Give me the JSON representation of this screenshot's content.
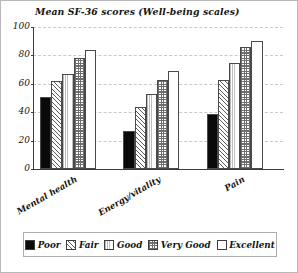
{
  "chart_data": {
    "type": "bar",
    "title": "Mean SF-36 scores (Well-being scales)",
    "xlabel": "",
    "ylabel": "",
    "ylim": [
      0,
      100
    ],
    "yticks": [
      0,
      20,
      40,
      60,
      80,
      100
    ],
    "grid": true,
    "legend_position": "bottom",
    "categories": [
      "Mental health",
      "Energy/vitality",
      "Pain"
    ],
    "series": [
      {
        "name": "Poor",
        "values": [
          51,
          27,
          39
        ],
        "pattern": "solid-black",
        "color": "#0a0a0a"
      },
      {
        "name": "Fair",
        "values": [
          62,
          44,
          63
        ],
        "pattern": "diagonal-hatch",
        "color": "#ffffff"
      },
      {
        "name": "Good",
        "values": [
          67,
          53,
          75
        ],
        "pattern": "fine-vertical-dots",
        "color": "#ffffff"
      },
      {
        "name": "Very Good",
        "values": [
          78,
          63,
          86
        ],
        "pattern": "checkerboard",
        "color": "#ffffff"
      },
      {
        "name": "Excellent",
        "values": [
          84,
          69,
          90
        ],
        "pattern": "empty",
        "color": "#ffffff"
      }
    ]
  },
  "legend": {
    "items": [
      {
        "label": "Poor"
      },
      {
        "label": "Fair"
      },
      {
        "label": "Good"
      },
      {
        "label": "Very Good"
      },
      {
        "label": "Excellent"
      }
    ]
  }
}
